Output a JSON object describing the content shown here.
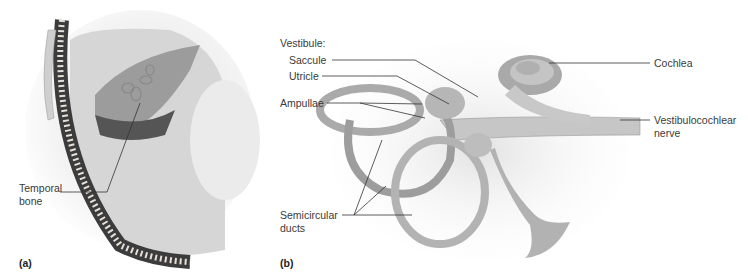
{
  "figure": {
    "panels": [
      {
        "id": "a",
        "label": "(a)"
      },
      {
        "id": "b",
        "label": "(b)"
      }
    ]
  },
  "panel_a": {
    "label": "(a)",
    "callouts": [
      {
        "line1": "Temporal",
        "line2": "bone"
      }
    ]
  },
  "panel_b": {
    "label": "(b)",
    "vestibule_heading": "Vestibule:",
    "callouts": {
      "saccule": "Saccule",
      "utricle": "Utricle",
      "ampullae": "Ampullae",
      "semicircular_1": "Semicircular",
      "semicircular_2": "ducts",
      "cochlea": "Cochlea",
      "nerve_1": "Vestibulocochlear",
      "nerve_2": "nerve"
    }
  },
  "colors": {
    "label_text": "#3a3a3a",
    "leader_line": "#333333",
    "structure_fill": "#b8b8b8",
    "structure_shade": "#8a8a8a",
    "skull_dark": "#3c3c3c"
  }
}
